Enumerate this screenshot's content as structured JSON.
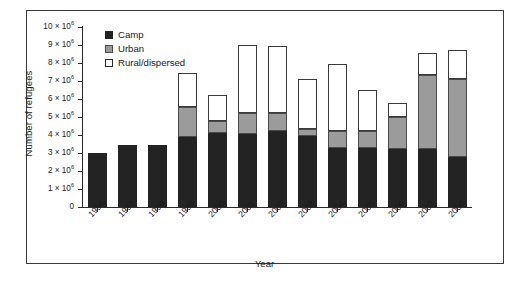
{
  "chart_data": {
    "type": "bar",
    "stacked": true,
    "title": "",
    "xlabel": "Year",
    "ylabel": "Number of refugees",
    "grid": false,
    "legend_position": "top-left",
    "ylim": [
      0,
      10000000
    ],
    "ytick_values": [
      0,
      1000000,
      2000000,
      3000000,
      4000000,
      5000000,
      6000000,
      7000000,
      8000000,
      9000000,
      10000000
    ],
    "ytick_labels": [
      "0",
      "1 × 10⁶",
      "2 × 10⁶",
      "3 × 10⁶",
      "4 × 10⁶",
      "5 × 10⁶",
      "6 × 10⁶",
      "7 × 10⁶",
      "8 × 10⁶",
      "9 × 10⁶",
      "10 × 10⁶"
    ],
    "categories": [
      "1996",
      "1997",
      "1998",
      "1999",
      "2000",
      "2001",
      "2002",
      "2003",
      "2004",
      "2005",
      "2006",
      "2007",
      "2008"
    ],
    "series": [
      {
        "name": "Camp",
        "color": "#232323",
        "values": [
          3000000,
          3450000,
          3450000,
          3900000,
          4100000,
          4050000,
          4200000,
          3950000,
          3300000,
          3300000,
          3200000,
          3200000,
          2800000
        ]
      },
      {
        "name": "Urban",
        "color": "#9b9b9b",
        "values": [
          0,
          0,
          0,
          1650000,
          700000,
          1150000,
          1050000,
          400000,
          950000,
          900000,
          1800000,
          4150000,
          4300000
        ]
      },
      {
        "name": "Rural/dispersed",
        "color": "#ffffff",
        "values": [
          0,
          0,
          0,
          1900000,
          1400000,
          3800000,
          3700000,
          2750000,
          3700000,
          2300000,
          800000,
          1200000,
          1600000
        ]
      }
    ],
    "totals": [
      3000000,
      3450000,
      3450000,
      7450000,
      6200000,
      9000000,
      8950000,
      7100000,
      7950000,
      6500000,
      5800000,
      8550000,
      8700000
    ]
  },
  "legend": {
    "items": [
      {
        "label": "Camp",
        "swatch": "camp"
      },
      {
        "label": "Urban",
        "swatch": "urban"
      },
      {
        "label": "Rural/dispersed",
        "swatch": "rural"
      }
    ]
  },
  "axes": {
    "y_title": "Number of refugees",
    "x_title": "Year"
  }
}
